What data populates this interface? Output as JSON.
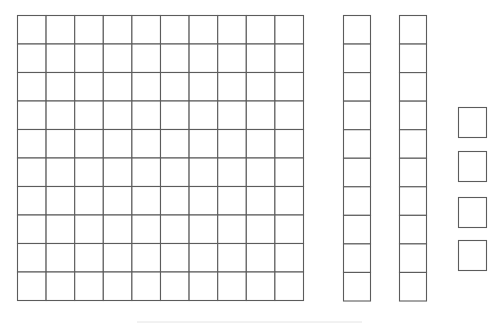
{
  "diagram": {
    "blocks": [
      {
        "kind": "hundred-flat",
        "rows": 10,
        "cols": 10,
        "value": 100
      },
      {
        "kind": "ten-rod",
        "rows": 10,
        "cols": 1,
        "value": 10
      },
      {
        "kind": "ten-rod",
        "rows": 10,
        "cols": 1,
        "value": 10
      },
      {
        "kind": "unit-cube",
        "rows": 1,
        "cols": 1,
        "value": 1
      },
      {
        "kind": "unit-cube",
        "rows": 1,
        "cols": 1,
        "value": 1
      },
      {
        "kind": "unit-cube",
        "rows": 1,
        "cols": 1,
        "value": 1
      },
      {
        "kind": "unit-cube",
        "rows": 1,
        "cols": 1,
        "value": 1
      }
    ],
    "counts": {
      "hundreds": 1,
      "tens": 2,
      "ones": 4
    },
    "colors": {
      "line": "#5c5c5c",
      "fill": "#ffffff",
      "background": "#ffffff"
    }
  }
}
